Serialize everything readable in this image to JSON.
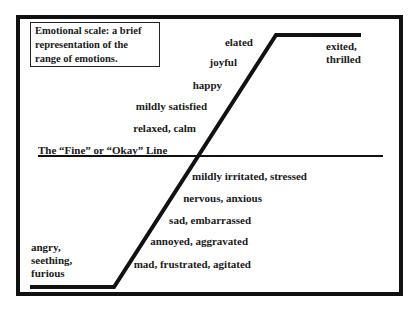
{
  "title": "Emotional scale: a brief representation of the range of emotions.",
  "fine_line_label": "The “Fine” or “Okay” Line",
  "positive_emotions": [
    {
      "label": "elated"
    },
    {
      "label": "joyful"
    },
    {
      "label": "happy"
    },
    {
      "label": "mildly satisfied"
    },
    {
      "label": "relaxed, calm"
    }
  ],
  "top_plateau": {
    "line1": "exited,",
    "line2": "thrilled"
  },
  "negative_emotions": [
    {
      "label": "mildly irritated, stressed"
    },
    {
      "label": "nervous, anxious"
    },
    {
      "label": "sad, embarrassed"
    },
    {
      "label": "annoyed, aggravated"
    },
    {
      "label": "mad, frustrated, agitated"
    }
  ],
  "bottom_plateau": {
    "line1": "angry,",
    "line2": "seething,",
    "line3": "furious"
  },
  "colors": {
    "line": "#111111",
    "background": "#ffffff",
    "text": "#1a1a1a"
  }
}
